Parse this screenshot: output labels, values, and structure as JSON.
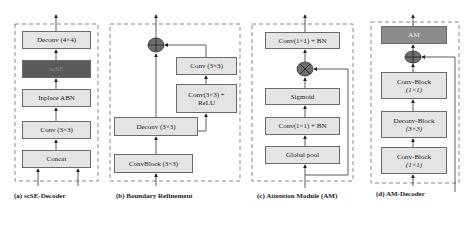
{
  "panels": [
    {
      "id": "a",
      "caption": "(a) scSE-Decoder",
      "blocks": [
        "Deconv (4×4)",
        "scSE",
        "Inplace ABN",
        "Conv (3×3)",
        "Concat"
      ]
    },
    {
      "id": "b",
      "caption": "(b) Boundary Refinement",
      "blocks": [
        "Conv (3×3)",
        "Conv(3×3) +",
        "ReLU",
        "Deconv (3×3)",
        "ConvBlock (3×3)"
      ],
      "operator": "add"
    },
    {
      "id": "c",
      "caption": "(c) Attention Module (AM)",
      "blocks": [
        "Conv(1×1) + BN",
        "Sigmoid",
        "Conv(1×1) + BN",
        "Global pool"
      ],
      "operator": "multiply"
    },
    {
      "id": "d",
      "caption": "(d) AM-Decoder",
      "blocks": [
        "AM",
        "Conv-Block",
        "(1×1)",
        "Deconv-Block",
        "(3×3)",
        "Conv-Block",
        "(1×1)"
      ],
      "operator": "add"
    }
  ],
  "colors": {
    "box_fill": "#e4e4e4",
    "box_dark": "#5a5a5a",
    "box_mid": "#8c8c8c",
    "operator_fill": "#6e6e6e",
    "line": "#333333",
    "dashed_border": "#6a6a6a"
  }
}
